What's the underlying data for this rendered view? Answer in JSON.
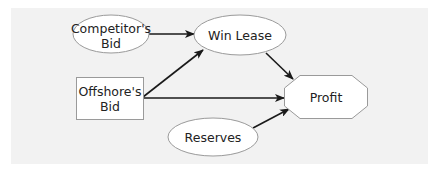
{
  "diagram": {
    "type": "influence-diagram",
    "background_color": "#f2f2f2",
    "nodes": [
      {
        "id": "competitors_bid",
        "label_lines": [
          "Competitor's",
          "Bid"
        ],
        "shape": "ellipse",
        "kind": "chance"
      },
      {
        "id": "win_lease",
        "label_lines": [
          "Win Lease"
        ],
        "shape": "ellipse",
        "kind": "chance"
      },
      {
        "id": "offshores_bid",
        "label_lines": [
          "Offshore's",
          "Bid"
        ],
        "shape": "rectangle",
        "kind": "decision"
      },
      {
        "id": "profit",
        "label_lines": [
          "Profit"
        ],
        "shape": "octagon",
        "kind": "value"
      },
      {
        "id": "reserves",
        "label_lines": [
          "Reserves"
        ],
        "shape": "ellipse",
        "kind": "chance"
      }
    ],
    "edges": [
      {
        "from": "competitors_bid",
        "to": "win_lease"
      },
      {
        "from": "offshores_bid",
        "to": "win_lease"
      },
      {
        "from": "offshores_bid",
        "to": "profit"
      },
      {
        "from": "win_lease",
        "to": "profit"
      },
      {
        "from": "reserves",
        "to": "profit"
      }
    ]
  }
}
